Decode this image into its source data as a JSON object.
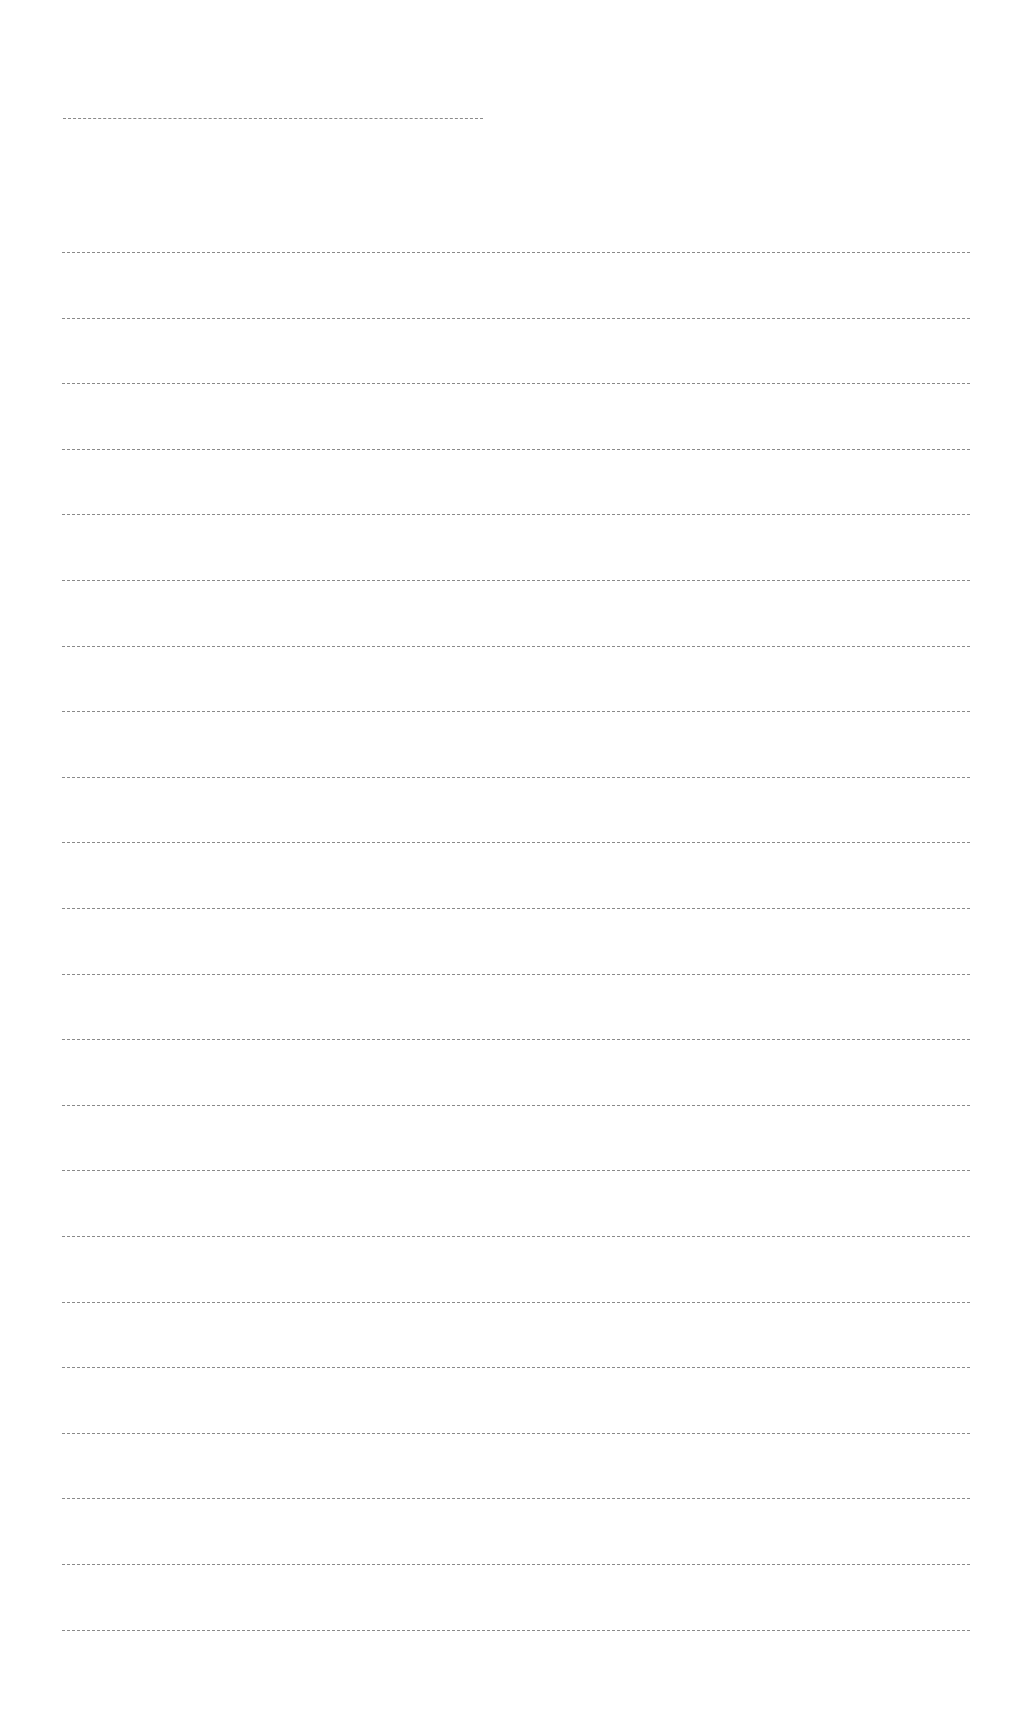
{
  "page": {
    "type": "blank-ruled-sheet",
    "background_color": "#ffffff",
    "line_color": "#8a8a8a"
  },
  "title_line": {
    "x": 63,
    "y": 118,
    "width": 420
  },
  "ruled_lines": {
    "count": 22,
    "x": 62,
    "width": 908,
    "first_y": 252,
    "spacing": 65.6
  }
}
